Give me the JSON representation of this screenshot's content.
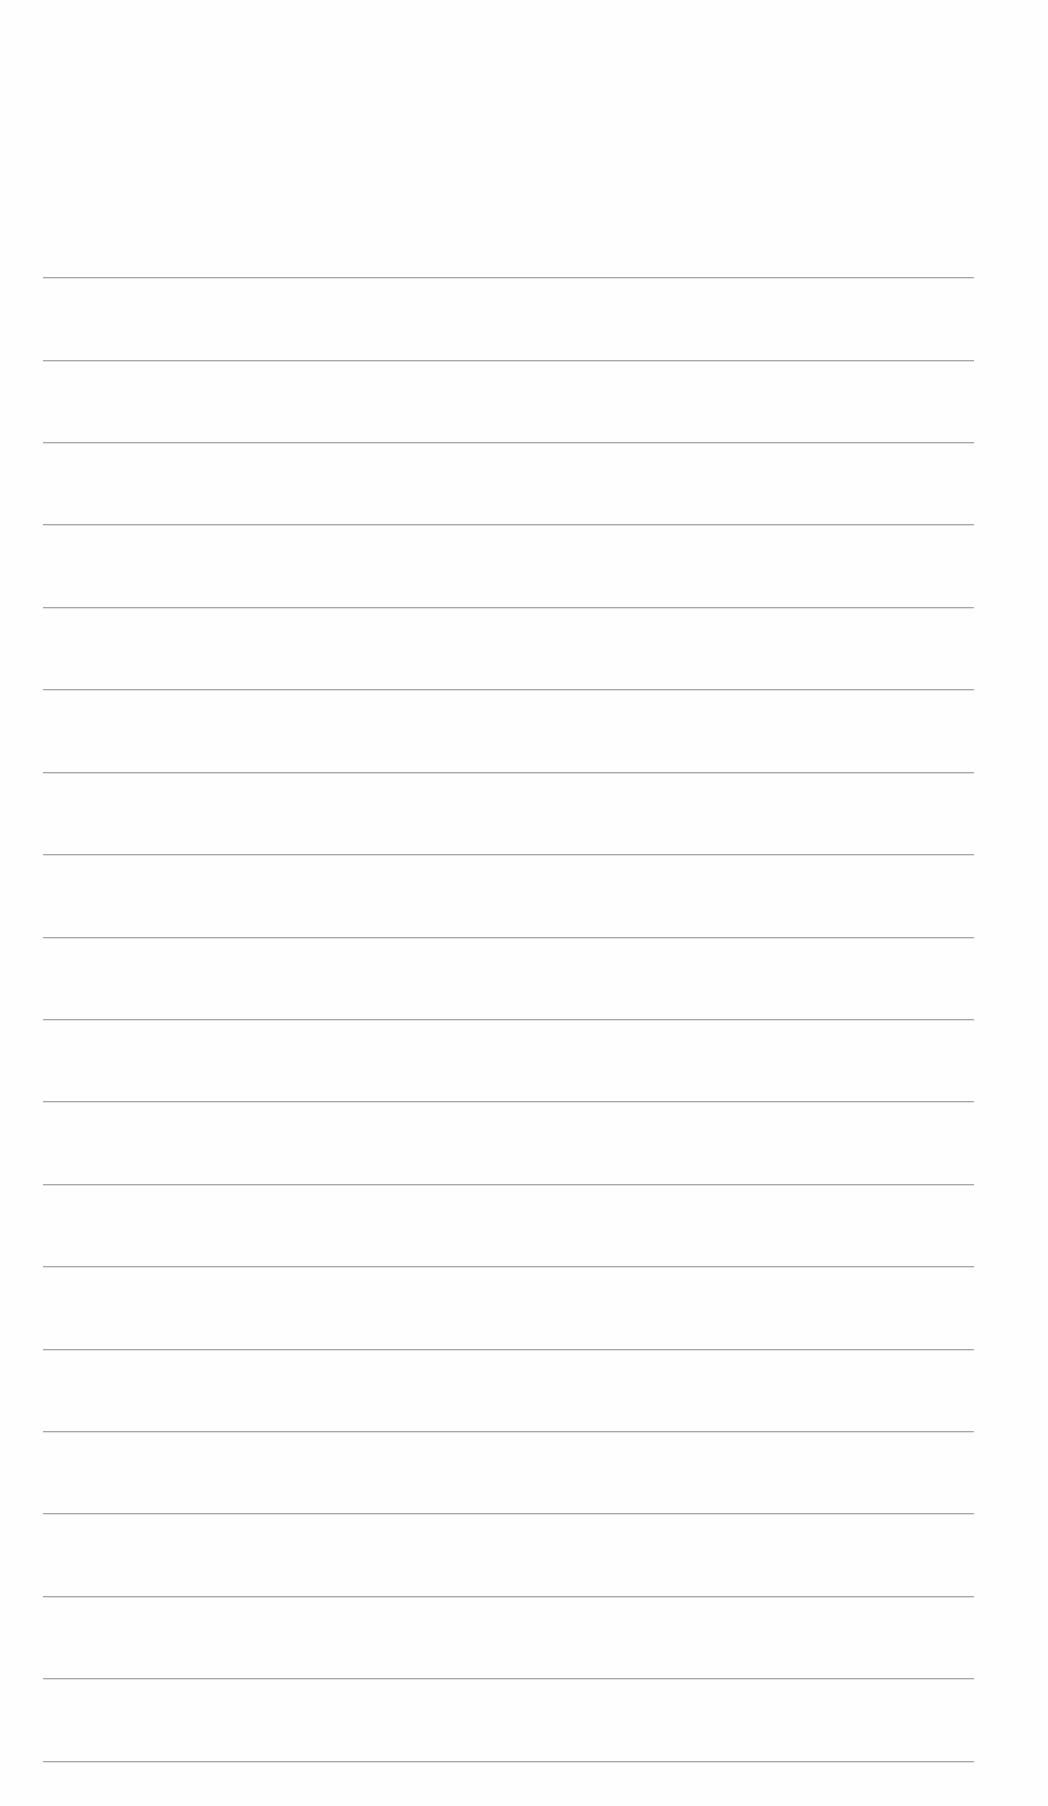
{
  "page": {
    "type": "ruled-paper",
    "background_color": "#fefefe",
    "rule_color": "#a6a6a6",
    "rule_count": 19,
    "rule_left": 43,
    "rule_width": 931,
    "rule_positions_y": [
      277,
      360,
      442,
      524,
      607,
      689,
      772,
      854,
      937,
      1019,
      1101,
      1184,
      1266,
      1349,
      1431,
      1513,
      1596,
      1678,
      1761
    ],
    "text_content": []
  }
}
